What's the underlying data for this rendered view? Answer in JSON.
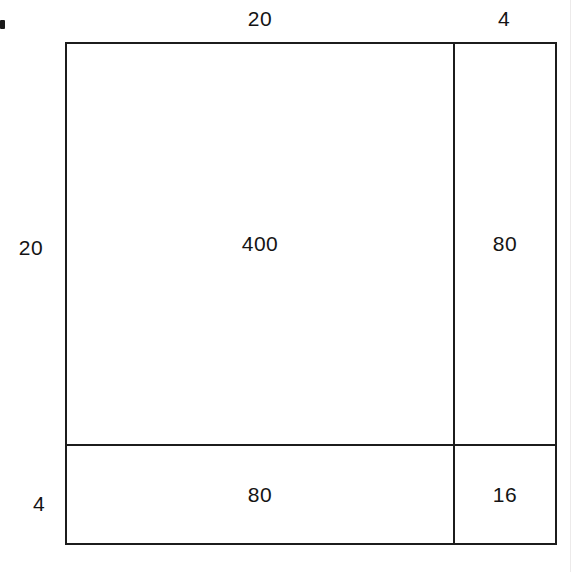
{
  "figure": {
    "type": "area-model-diagram",
    "stroke_color": "#1c1c1c",
    "background_color": "#ffffff",
    "text_color": "#141414"
  },
  "dimension_labels": {
    "top_left": "20",
    "top_right": "4",
    "left_upper": "20",
    "left_lower": "4"
  },
  "cells": {
    "top_left": "400",
    "top_right": "80",
    "bottom_left": "80",
    "bottom_right": "16"
  },
  "chart_data": {
    "type": "table",
    "title": "",
    "xlabel": "",
    "ylabel": "",
    "column_headers": [
      "20",
      "4"
    ],
    "row_headers": [
      "20",
      "4"
    ],
    "rows": [
      [
        "400",
        "80"
      ],
      [
        "80",
        "16"
      ]
    ],
    "grid": true,
    "annotations": []
  }
}
